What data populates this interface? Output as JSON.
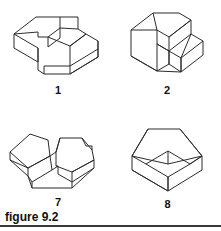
{
  "page": {
    "background_color": "#ffffff",
    "ink_color": "#2b2b2b",
    "text_color": "#111111",
    "width": 221,
    "height": 231
  },
  "caption": {
    "text": "figure 9.2",
    "rule_color": "#3a3a3a"
  },
  "figures": [
    {
      "id": "figure-1",
      "label": "1",
      "description": "isometric block with rectangular notch cut in top left and step at front",
      "position": "top-left"
    },
    {
      "id": "figure-2",
      "label": "2",
      "description": "isometric block with vertical upright wall and angled slot on right side",
      "position": "top-right"
    },
    {
      "id": "figure-7",
      "label": "7",
      "description": "isometric V-shaped trough block with slanted inner faces and small notch at right",
      "position": "bottom-left"
    },
    {
      "id": "figure-8",
      "label": "8",
      "description": "isometric open box with sloped pyramid-like walls rising from rear edges",
      "position": "bottom-right"
    }
  ]
}
